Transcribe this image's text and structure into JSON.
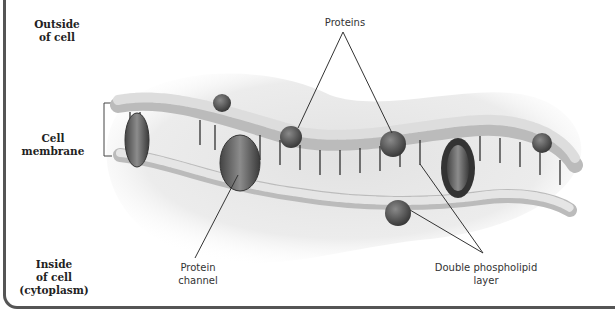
{
  "diagram": {
    "type": "cell membrane cross-section",
    "region_labels": {
      "outside": {
        "line1": "Outside",
        "line2": "of cell"
      },
      "membrane": {
        "line1": "Cell",
        "line2": "membrane"
      },
      "inside": {
        "line1": "Inside",
        "line2": "of cell",
        "line3": "(cytoplasm)"
      }
    },
    "callouts": {
      "proteins": "Proteins",
      "protein_channel": {
        "line1": "Protein",
        "line2": "channel"
      },
      "phospholipid": {
        "line1": "Double phospholipid",
        "line2": "layer"
      }
    },
    "colors": {
      "frame": "#555555",
      "background_blob": "#e6e6e6",
      "phospholipid_head": "#f2f2f2",
      "protein": "#5a5a5a",
      "leader_line": "#333333"
    }
  }
}
